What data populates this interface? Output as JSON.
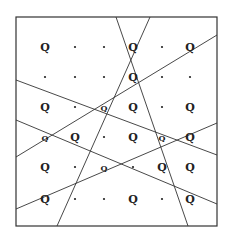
{
  "diagram": {
    "colors": {
      "background": "#ffffff",
      "stroke": "#333333",
      "ink": "#222222"
    },
    "frame": {
      "x1": 16,
      "y1": 17,
      "x2": 217,
      "y2": 226
    },
    "lines": [
      {
        "x1": 116,
        "y1": 17,
        "x2": 188,
        "y2": 226
      },
      {
        "x1": 150,
        "y1": 17,
        "x2": 57,
        "y2": 226
      },
      {
        "x1": 16,
        "y1": 80,
        "x2": 217,
        "y2": 155
      },
      {
        "x1": 16,
        "y1": 120,
        "x2": 217,
        "y2": 204
      },
      {
        "x1": 16,
        "y1": 157,
        "x2": 217,
        "y2": 35
      },
      {
        "x1": 16,
        "y1": 209,
        "x2": 217,
        "y2": 123
      }
    ],
    "columns": [
      45,
      75,
      104,
      133,
      162,
      190
    ],
    "rows": [
      47,
      77,
      107,
      137,
      167,
      199
    ],
    "grid": [
      [
        "Q",
        ".",
        ".",
        "Q",
        ".",
        "Q"
      ],
      [
        ".",
        ".",
        ".",
        "Q",
        ".",
        "."
      ],
      [
        "Q",
        ".",
        "q",
        "Q",
        ".",
        "Q"
      ],
      [
        "q",
        "Q",
        ".",
        "Q",
        "q",
        "Q"
      ],
      [
        "Q",
        ".",
        "q",
        ".",
        "Q",
        "Q"
      ],
      [
        "Q",
        ".",
        ".",
        "Q",
        ".",
        "Q"
      ]
    ],
    "marker_label": "Q"
  }
}
